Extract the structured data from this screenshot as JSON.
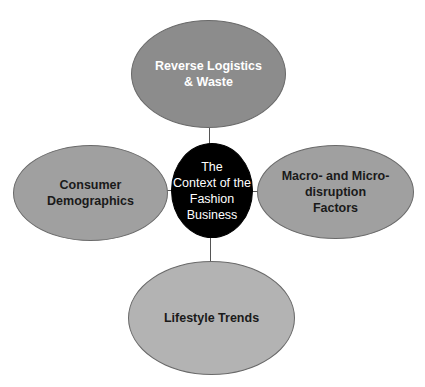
{
  "diagram": {
    "type": "hub-and-spoke",
    "center": {
      "label": "The Context of the Fashion Business",
      "lines": [
        "The",
        "Context of the",
        "Fashion",
        "Business"
      ],
      "fill": "#000000",
      "text_color": "#ffffff"
    },
    "nodes": [
      {
        "id": "top",
        "position": "top",
        "lines": [
          "Reverse Logistics",
          "& Waste"
        ],
        "label": "Reverse Logistics & Waste",
        "fill": "#8c8c8c",
        "text_color": "#ffffff"
      },
      {
        "id": "left",
        "position": "left",
        "lines": [
          "Consumer",
          "Demographics"
        ],
        "label": "Consumer Demographics",
        "fill": "#a0a0a0",
        "text_color": "#1a1a1a"
      },
      {
        "id": "right",
        "position": "right",
        "lines": [
          "Macro- and Micro-",
          "disruption",
          "Factors"
        ],
        "label": "Macro- and Micro-disruption Factors",
        "fill": "#a0a0a0",
        "text_color": "#1a1a1a"
      },
      {
        "id": "bottom",
        "position": "bottom",
        "lines": [
          "Lifestyle Trends"
        ],
        "label": "Lifestyle Trends",
        "fill": "#b3b3b3",
        "text_color": "#1a1a1a"
      }
    ],
    "connector_color": "#555555"
  }
}
